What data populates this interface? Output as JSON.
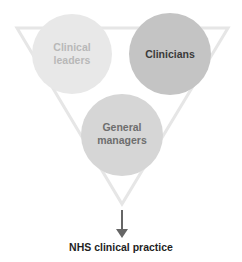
{
  "diagram": {
    "type": "venn-triangle",
    "triangle": {
      "color": "#e6e6e6",
      "stroke_width": 3
    },
    "circles": [
      {
        "id": "clinical-leaders",
        "label_line1": "Clinical",
        "label_line2": "leaders",
        "fill": "#e8e8e8",
        "text_color": "#b8b8b8"
      },
      {
        "id": "clinicians",
        "label_line1": "Clinicians",
        "label_line2": "",
        "fill": "#c4c4c4",
        "text_color": "#3a3a3a"
      },
      {
        "id": "general-managers",
        "label_line1": "General",
        "label_line2": "managers",
        "fill": "#d6d6d6",
        "text_color": "#6e6e6e"
      }
    ],
    "arrow": {
      "color": "#666666"
    },
    "outcome_label": "NHS clinical practice"
  }
}
